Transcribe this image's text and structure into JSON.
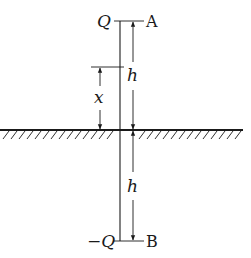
{
  "diagram": {
    "labels": {
      "top_charge": "Q",
      "top_point": "A",
      "bottom_charge": "−Q",
      "bottom_point": "B",
      "upper_distance": "h",
      "lower_distance": "h",
      "height_x": "x"
    },
    "colors": {
      "stroke": "#1a1a1a",
      "background": "#ffffff"
    }
  }
}
